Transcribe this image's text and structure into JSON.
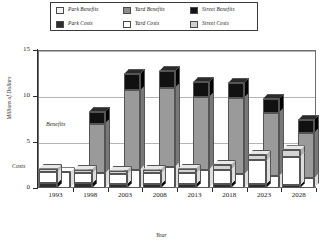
{
  "chart_data": {
    "type": "bar",
    "title": "",
    "xlabel": "Year",
    "ylabel": "Millions of Dollars",
    "categories": [
      "1993",
      "1998",
      "2003",
      "2008",
      "2013",
      "2018",
      "2023",
      "2028"
    ],
    "ylim": [
      0,
      15
    ],
    "yticks": [
      0,
      5,
      10,
      15
    ],
    "grid": true,
    "legend_position": "top",
    "annotations": [
      {
        "text": "Benefits",
        "x": 0.16,
        "y": 6.9
      },
      {
        "text": "Costs",
        "x": 0.02,
        "y": 0.9
      }
    ],
    "series": [
      {
        "name": "Park Benefits",
        "group": "Benefits",
        "color": "#ffffff",
        "values": [
          1.7,
          1.6,
          2.0,
          2.3,
          2.0,
          1.5,
          1.3,
          1.1
        ]
      },
      {
        "name": "Yard Benefits",
        "group": "Benefits",
        "color": "#9a9a9a",
        "values": [
          0.0,
          5.4,
          8.6,
          8.6,
          7.9,
          8.3,
          6.9,
          4.9
        ]
      },
      {
        "name": "Street Benefits",
        "group": "Benefits",
        "color": "#111111",
        "values": [
          0.0,
          1.3,
          1.8,
          1.8,
          1.6,
          1.6,
          1.5,
          1.4
        ]
      },
      {
        "name": "Park Costs",
        "group": "Costs",
        "color": "#2e2e2e",
        "values": [
          0.5,
          0.5,
          0.4,
          0.4,
          0.4,
          0.4,
          0.4,
          0.3
        ]
      },
      {
        "name": "Yard Costs",
        "group": "Costs",
        "color": "#ffffff",
        "values": [
          1.2,
          1.1,
          1.1,
          1.2,
          1.2,
          1.6,
          2.6,
          3.1
        ]
      },
      {
        "name": "Street Costs",
        "group": "Costs",
        "color": "#d4d4d4",
        "values": [
          0.4,
          0.4,
          0.4,
          0.4,
          0.5,
          0.5,
          0.6,
          0.7
        ]
      }
    ],
    "benefit_totals": [
      1.7,
      8.3,
      12.4,
      12.7,
      11.5,
      11.4,
      9.7,
      7.4
    ],
    "cost_totals": [
      2.1,
      2.0,
      1.9,
      2.0,
      2.1,
      2.5,
      3.6,
      4.1
    ]
  },
  "legend": {
    "rows": [
      [
        {
          "label": "Park Benefits",
          "swatch": "#f2f2f2"
        },
        {
          "label": "Yard Benefits",
          "swatch": "#8d8d8d"
        },
        {
          "label": "Street Benefits",
          "swatch": "#141414"
        }
      ],
      [
        {
          "label": "Park Costs",
          "swatch": "#2e2e2e"
        },
        {
          "label": "Yard Costs",
          "swatch": "#ffffff"
        },
        {
          "label": "Street Costs",
          "swatch": "#cfcfcf"
        }
      ]
    ]
  },
  "axes": {
    "ylabel": "Millions of Dollars",
    "xlabel": "Year",
    "ytick_labels": [
      "15",
      "10",
      "5",
      "0"
    ],
    "xtick_labels": [
      "1993",
      "1998",
      "2003",
      "2008",
      "2013",
      "2018",
      "2023",
      "2028"
    ]
  },
  "annotations": {
    "benefits": "Benefits",
    "costs": "Costs"
  }
}
